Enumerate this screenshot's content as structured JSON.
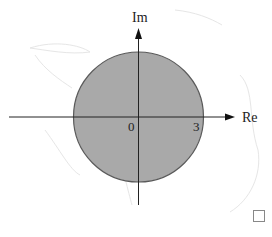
{
  "diagram": {
    "axes": {
      "real_label": "Re",
      "imag_label": "Im"
    },
    "tick_labels": {
      "origin": "0",
      "radius": "3"
    },
    "disk": {
      "center": [
        0,
        0
      ],
      "radius": 3,
      "fill_color": "#a9a9a9",
      "stroke_color": "#555555"
    },
    "end_marker": "□"
  }
}
